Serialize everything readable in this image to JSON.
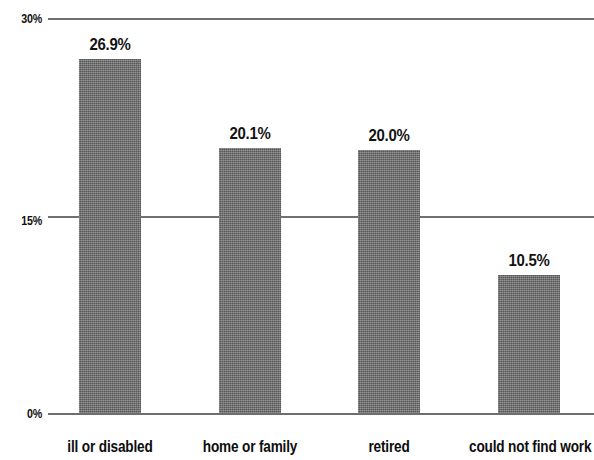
{
  "chart_data": {
    "type": "bar",
    "title": "",
    "subtitle": "",
    "xlabel": "",
    "ylabel": "",
    "categories": [
      "ill or disabled",
      "home or family",
      "retired",
      "could not find work"
    ],
    "values": [
      26.9,
      20.1,
      20.0,
      10.5
    ],
    "value_labels": [
      "26.9%",
      "20.1%",
      "20.0%",
      "10.5%"
    ],
    "ylim": [
      0,
      30
    ],
    "yticks": [
      0,
      15,
      30
    ],
    "ytick_labels": [
      "0%",
      "15%",
      "30%"
    ],
    "grid": true,
    "legend": false,
    "legend_position": "none",
    "bar_color": "#6b6b6b",
    "gridline_color": "#707070",
    "text_color": "#111111",
    "background": "#ffffff"
  },
  "axis": {
    "y": {
      "ticks": [
        {
          "label": "30%",
          "value": 30
        },
        {
          "label": "15%",
          "value": 15
        },
        {
          "label": "0%",
          "value": 0
        }
      ]
    }
  },
  "bars": [
    {
      "category": "ill or disabled",
      "value": 26.9,
      "label": "26.9%"
    },
    {
      "category": "home or family",
      "value": 20.1,
      "label": "20.1%"
    },
    {
      "category": "retired",
      "value": 20.0,
      "label": "20.0%"
    },
    {
      "category": "could not find work",
      "value": 10.5,
      "label": "10.5%"
    }
  ]
}
